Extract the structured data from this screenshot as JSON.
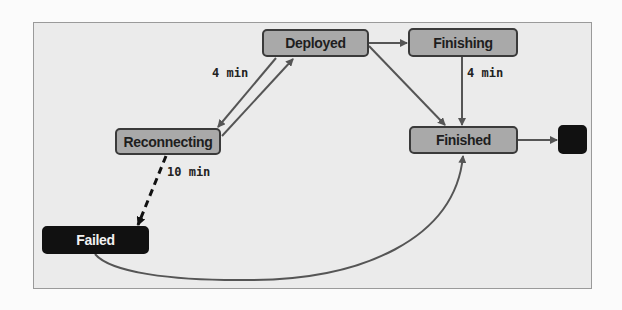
{
  "diagram": {
    "type": "state-machine",
    "colors": {
      "page_background": "#fbfbfb",
      "frame_background": "#ebebeb",
      "node_fill": "#a9a9a9",
      "node_border": "#3a3a3a",
      "node_text": "#1e1e1e",
      "failed_fill": "#111111",
      "failed_text": "#f2f2f2",
      "edge": "#555555"
    },
    "nodes": [
      {
        "id": "deployed",
        "label": "Deployed",
        "style": "normal"
      },
      {
        "id": "finishing",
        "label": "Finishing",
        "style": "normal"
      },
      {
        "id": "reconnecting",
        "label": "Reconnecting",
        "style": "normal"
      },
      {
        "id": "finished",
        "label": "Finished",
        "style": "normal"
      },
      {
        "id": "failed",
        "label": "Failed",
        "style": "dark"
      },
      {
        "id": "end",
        "label": "",
        "style": "terminal"
      }
    ],
    "edges": [
      {
        "from": "deployed",
        "to": "finishing",
        "label": "",
        "style": "solid"
      },
      {
        "from": "deployed",
        "to": "finished",
        "label": "",
        "style": "solid"
      },
      {
        "from": "deployed",
        "to": "reconnecting",
        "label": "4 min",
        "style": "solid"
      },
      {
        "from": "reconnecting",
        "to": "deployed",
        "label": "",
        "style": "solid"
      },
      {
        "from": "finishing",
        "to": "finished",
        "label": "4 min",
        "style": "solid"
      },
      {
        "from": "reconnecting",
        "to": "failed",
        "label": "10 min",
        "style": "dashed"
      },
      {
        "from": "failed",
        "to": "finished",
        "label": "",
        "style": "curved"
      },
      {
        "from": "finished",
        "to": "end",
        "label": "",
        "style": "solid"
      }
    ],
    "edge_labels": {
      "deployed_reconnecting": "4 min",
      "finishing_finished": "4 min",
      "reconnecting_failed": "10 min"
    }
  }
}
